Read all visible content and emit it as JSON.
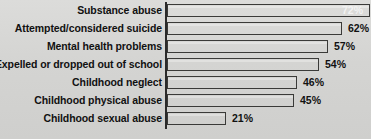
{
  "chart_data": {
    "type": "bar",
    "orientation": "horizontal",
    "title": "",
    "subtitle": "",
    "xlabel": "",
    "ylabel": "",
    "xlim": [
      0,
      72
    ],
    "grid": false,
    "legend": null,
    "value_suffix": "%",
    "categories": [
      "Substance abuse",
      "Attempted/considered suicide",
      "Mental health problems",
      "Expelled or dropped out of school",
      "Childhood neglect",
      "Childhood physical abuse",
      "Childhood sexual abuse"
    ],
    "values": [
      72,
      62,
      57,
      54,
      46,
      45,
      21
    ],
    "value_labels": [
      "72%",
      "62%",
      "57%",
      "54%",
      "46%",
      "45%",
      "21%"
    ],
    "label_placement": [
      "inside",
      "outside",
      "outside",
      "outside",
      "outside",
      "outside",
      "outside"
    ]
  },
  "style": {
    "background_color": "#d6d6d4",
    "bar_fill_dark": "#4e4e4c",
    "bar_fill_light": "#bfbfbd",
    "bar_border_color": "#3a3a38",
    "axis_color": "#2a2a2a",
    "text_color": "#111111",
    "inside_label_color": "#f2f2f2"
  },
  "geometry": {
    "axis_x_px": 166,
    "px_per_percent": 2.82,
    "bar_height_px": 13,
    "row_pitch_px": 18,
    "first_row_top_px": 4
  }
}
